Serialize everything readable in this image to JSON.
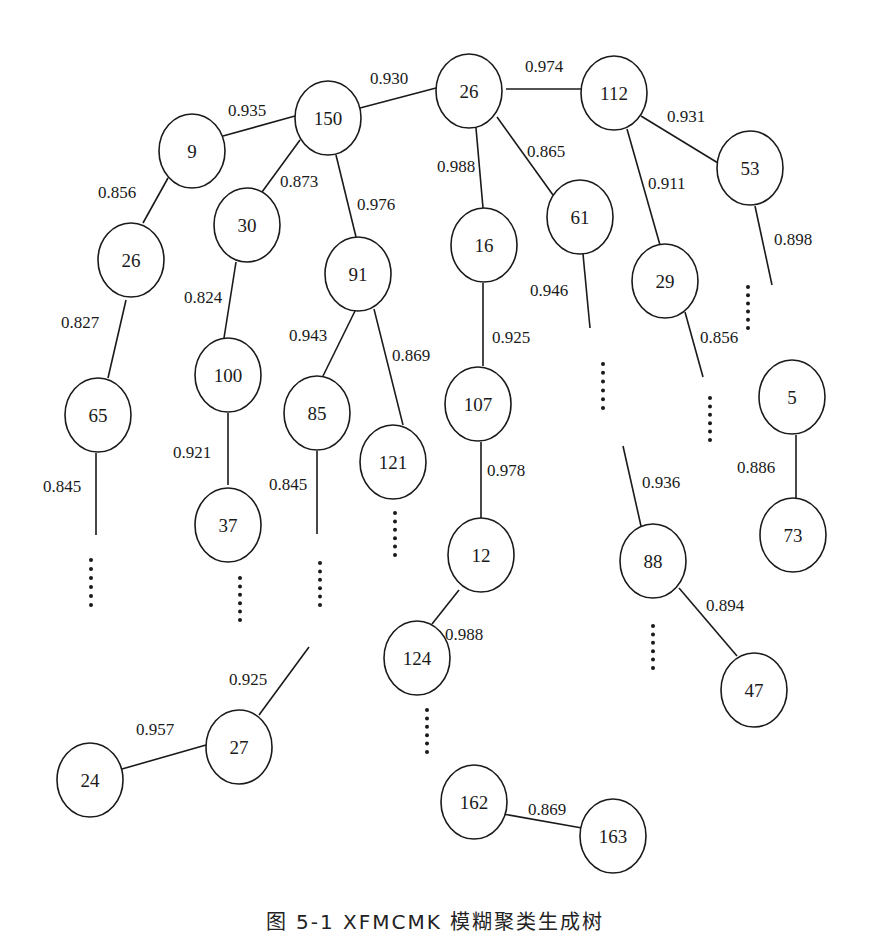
{
  "diagram": {
    "type": "tree",
    "style": {
      "stroke_color": "#1a1a1a",
      "background": "#ffffff",
      "node_fill": "#ffffff",
      "node_rx": 33,
      "node_ry": 37
    },
    "nodes": [
      {
        "id": "n150",
        "label": "150",
        "x": 328,
        "y": 118
      },
      {
        "id": "n9",
        "label": "9",
        "x": 192,
        "y": 151
      },
      {
        "id": "n26a",
        "label": "26",
        "x": 469,
        "y": 91
      },
      {
        "id": "n112",
        "label": "112",
        "x": 614,
        "y": 93
      },
      {
        "id": "n53",
        "label": "53",
        "x": 750,
        "y": 168
      },
      {
        "id": "n26b",
        "label": "26",
        "x": 131,
        "y": 260
      },
      {
        "id": "n30",
        "label": "30",
        "x": 247,
        "y": 225
      },
      {
        "id": "n91",
        "label": "91",
        "x": 358,
        "y": 274
      },
      {
        "id": "n16",
        "label": "16",
        "x": 484,
        "y": 245
      },
      {
        "id": "n61",
        "label": "61",
        "x": 580,
        "y": 217
      },
      {
        "id": "n29",
        "label": "29",
        "x": 665,
        "y": 281
      },
      {
        "id": "n65",
        "label": "65",
        "x": 98,
        "y": 415
      },
      {
        "id": "n100",
        "label": "100",
        "x": 228,
        "y": 375
      },
      {
        "id": "n85",
        "label": "85",
        "x": 317,
        "y": 413
      },
      {
        "id": "n121",
        "label": "121",
        "x": 393,
        "y": 462
      },
      {
        "id": "n107",
        "label": "107",
        "x": 478,
        "y": 404
      },
      {
        "id": "n5",
        "label": "5",
        "x": 792,
        "y": 397
      },
      {
        "id": "n37",
        "label": "37",
        "x": 228,
        "y": 525
      },
      {
        "id": "n12",
        "label": "12",
        "x": 481,
        "y": 555
      },
      {
        "id": "n88",
        "label": "88",
        "x": 653,
        "y": 561
      },
      {
        "id": "n73",
        "label": "73",
        "x": 793,
        "y": 535
      },
      {
        "id": "n124",
        "label": "124",
        "x": 417,
        "y": 658
      },
      {
        "id": "n47",
        "label": "47",
        "x": 754,
        "y": 690
      },
      {
        "id": "n27",
        "label": "27",
        "x": 239,
        "y": 747
      },
      {
        "id": "n24",
        "label": "24",
        "x": 90,
        "y": 780
      },
      {
        "id": "n162",
        "label": "162",
        "x": 474,
        "y": 802
      },
      {
        "id": "n163",
        "label": "163",
        "x": 613,
        "y": 836
      }
    ],
    "edges": [
      {
        "from": "n150",
        "to": "n26a",
        "weight": "0.930",
        "x1": 360,
        "y1": 108,
        "x2": 436,
        "y2": 88,
        "lx": 370,
        "ly": 84
      },
      {
        "from": "n9",
        "to": "n150",
        "weight": "0.935",
        "x1": 223,
        "y1": 136,
        "x2": 295,
        "y2": 116,
        "lx": 228,
        "ly": 116
      },
      {
        "from": "n26a",
        "to": "n112",
        "weight": "0.974",
        "x1": 506,
        "y1": 89,
        "x2": 582,
        "y2": 89,
        "lx": 525,
        "ly": 72
      },
      {
        "from": "n112",
        "to": "n53",
        "weight": "0.931",
        "x1": 641,
        "y1": 116,
        "x2": 718,
        "y2": 163,
        "lx": 667,
        "ly": 122
      },
      {
        "from": "n9",
        "to": "n26b",
        "weight": "0.856",
        "x1": 168,
        "y1": 178,
        "x2": 143,
        "y2": 223,
        "lx": 98,
        "ly": 198
      },
      {
        "from": "n150",
        "to": "n30",
        "weight": "0.873",
        "x1": 300,
        "y1": 140,
        "x2": 262,
        "y2": 192,
        "lx": 280,
        "ly": 187
      },
      {
        "from": "n150",
        "to": "n91",
        "weight": "0.976",
        "x1": 336,
        "y1": 155,
        "x2": 356,
        "y2": 237,
        "lx": 357,
        "ly": 210
      },
      {
        "from": "n26a",
        "to": "n16",
        "weight": "0.988",
        "x1": 476,
        "y1": 128,
        "x2": 483,
        "y2": 208,
        "lx": 437,
        "ly": 172
      },
      {
        "from": "n26a",
        "to": "n61",
        "weight": "0.865",
        "x1": 497,
        "y1": 117,
        "x2": 553,
        "y2": 195,
        "lx": 527,
        "ly": 157
      },
      {
        "from": "n112",
        "to": "n29",
        "weight": "0.911",
        "x1": 627,
        "y1": 129,
        "x2": 660,
        "y2": 245,
        "lx": 648,
        "ly": 189
      },
      {
        "from": "n53",
        "to": "n5",
        "weight": "0.898",
        "x1": 755,
        "y1": 206,
        "x2": 772,
        "y2": 285,
        "lx": 774,
        "ly": 245
      },
      {
        "from": "n26b",
        "to": "n65",
        "weight": "0.827",
        "x1": 126,
        "y1": 300,
        "x2": 108,
        "y2": 378,
        "lx": 61,
        "ly": 328
      },
      {
        "from": "n30",
        "to": "n100",
        "weight": "0.824",
        "x1": 236,
        "y1": 262,
        "x2": 224,
        "y2": 338,
        "lx": 184,
        "ly": 303
      },
      {
        "from": "n91",
        "to": "n85",
        "weight": "0.943",
        "x1": 355,
        "y1": 311,
        "x2": 323,
        "y2": 376,
        "lx": 289,
        "ly": 341
      },
      {
        "from": "n91",
        "to": "n121",
        "weight": "0.869",
        "x1": 374,
        "y1": 309,
        "x2": 403,
        "y2": 425,
        "lx": 392,
        "ly": 361
      },
      {
        "from": "n16",
        "to": "n107",
        "weight": "0.925",
        "x1": 483,
        "y1": 283,
        "x2": 483,
        "y2": 366,
        "lx": 492,
        "ly": 343
      },
      {
        "from": "n61",
        "to": "n88",
        "weight": "0.946",
        "x1": 583,
        "y1": 254,
        "x2": 590,
        "y2": 328,
        "lx": 530,
        "ly": 296
      },
      {
        "from": "n29",
        "to": "n88",
        "weight": "0.856",
        "x1": 685,
        "y1": 312,
        "x2": 703,
        "y2": 377,
        "lx": 700,
        "ly": 343
      },
      {
        "from": "n100",
        "to": "n37",
        "weight": "0.921",
        "x1": 228,
        "y1": 413,
        "x2": 228,
        "y2": 485,
        "lx": 173,
        "ly": 458
      },
      {
        "from": "n65",
        "to": "n_more1",
        "weight": "0.845",
        "x1": 96,
        "y1": 453,
        "x2": 96,
        "y2": 535,
        "lx": 43,
        "ly": 492
      },
      {
        "from": "n85",
        "to": "n_more2",
        "weight": "0.845",
        "x1": 317,
        "y1": 451,
        "x2": 317,
        "y2": 534,
        "lx": 269,
        "ly": 490
      },
      {
        "from": "n107",
        "to": "n12",
        "weight": "0.978",
        "x1": 481,
        "y1": 442,
        "x2": 481,
        "y2": 519,
        "lx": 487,
        "ly": 476
      },
      {
        "from": "n88",
        "to": "n88_up",
        "weight": "0.936",
        "x1": 623,
        "y1": 446,
        "x2": 641,
        "y2": 526,
        "lx": 642,
        "ly": 488
      },
      {
        "from": "n5",
        "to": "n73",
        "weight": "0.886",
        "x1": 796,
        "y1": 435,
        "x2": 796,
        "y2": 499,
        "lx": 737,
        "ly": 473
      },
      {
        "from": "n12",
        "to": "n124",
        "weight": "0.988",
        "x1": 459,
        "y1": 590,
        "x2": 432,
        "y2": 624,
        "lx": 445,
        "ly": 640
      },
      {
        "from": "n88",
        "to": "n47",
        "weight": "0.894",
        "x1": 679,
        "y1": 588,
        "x2": 737,
        "y2": 656,
        "lx": 706,
        "ly": 611
      },
      {
        "from": "n27",
        "to": "n_up",
        "weight": "0.925",
        "x1": 259,
        "y1": 715,
        "x2": 309,
        "y2": 647,
        "lx": 229,
        "ly": 685
      },
      {
        "from": "n24",
        "to": "n27",
        "weight": "0.957",
        "x1": 122,
        "y1": 769,
        "x2": 206,
        "y2": 745,
        "lx": 136,
        "ly": 735
      },
      {
        "from": "n162",
        "to": "n163",
        "weight": "0.869",
        "x1": 503,
        "y1": 814,
        "x2": 582,
        "y2": 828,
        "lx": 528,
        "ly": 815
      }
    ],
    "ellipses": [
      {
        "x": 91,
        "y1": 560,
        "y2": 605
      },
      {
        "x": 240,
        "y1": 578,
        "y2": 620
      },
      {
        "x": 320,
        "y1": 563,
        "y2": 605
      },
      {
        "x": 395,
        "y1": 513,
        "y2": 555
      },
      {
        "x": 603,
        "y1": 364,
        "y2": 408
      },
      {
        "x": 710,
        "y1": 398,
        "y2": 440
      },
      {
        "x": 748,
        "y1": 287,
        "y2": 328
      },
      {
        "x": 653,
        "y1": 626,
        "y2": 668
      },
      {
        "x": 427,
        "y1": 710,
        "y2": 752
      }
    ]
  },
  "caption": "图 5-1 XFMCMK 模糊聚类生成树"
}
